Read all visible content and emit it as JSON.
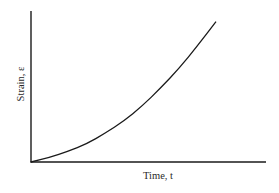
{
  "chart_data": {
    "type": "line",
    "title": "",
    "xlabel": "Time, t",
    "ylabel": "Strain, ε",
    "x": [
      0,
      0.1,
      0.2,
      0.3,
      0.4,
      0.5,
      0.6,
      0.7,
      0.8,
      0.9,
      1.0
    ],
    "series": [
      {
        "name": "Strain vs Time",
        "values": [
          0,
          0.03,
          0.07,
          0.12,
          0.19,
          0.27,
          0.37,
          0.49,
          0.62,
          0.77,
          0.93
        ]
      }
    ],
    "xlim": [
      0,
      1.27
    ],
    "ylim": [
      0,
      1.0
    ],
    "grid": false,
    "legend": "none",
    "ticks": "none",
    "colors": {
      "axis": "#1a1a1a",
      "curve": "#1a1a1a",
      "background": "#ffffff"
    }
  }
}
